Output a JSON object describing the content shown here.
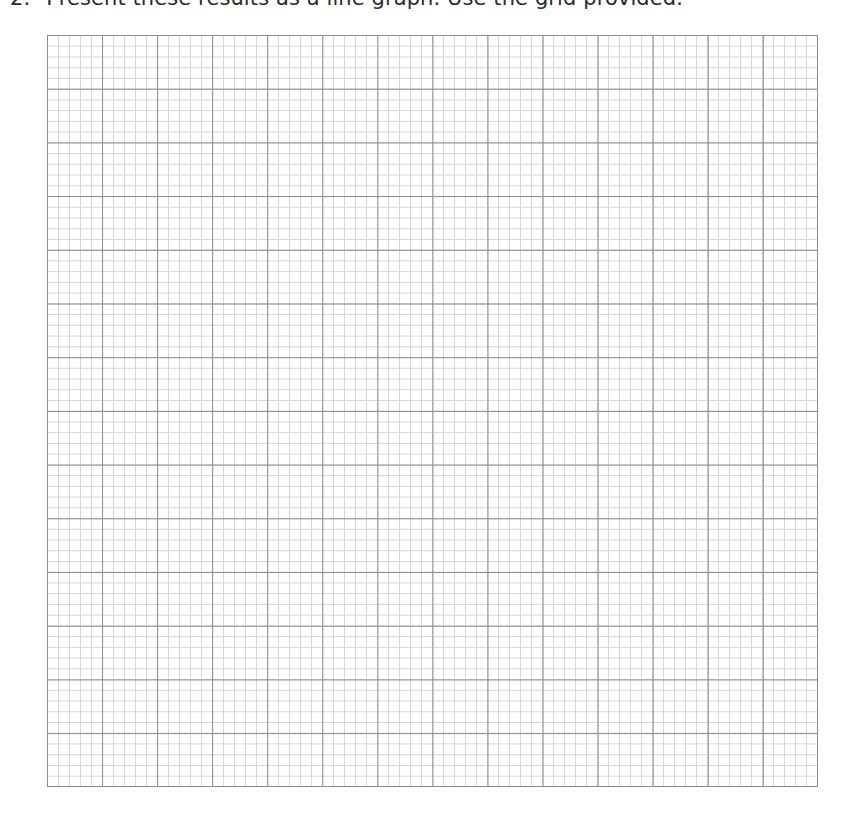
{
  "question": {
    "number": "2.",
    "text": "Present these results as a line graph. Use the grid provided."
  },
  "grid": {
    "major_columns": 14,
    "major_rows": 14,
    "minor_subdivisions_per_major": 5,
    "major_line_color": "#8c8c8c",
    "minor_line_color": "#d6d6d6",
    "state": "blank"
  }
}
